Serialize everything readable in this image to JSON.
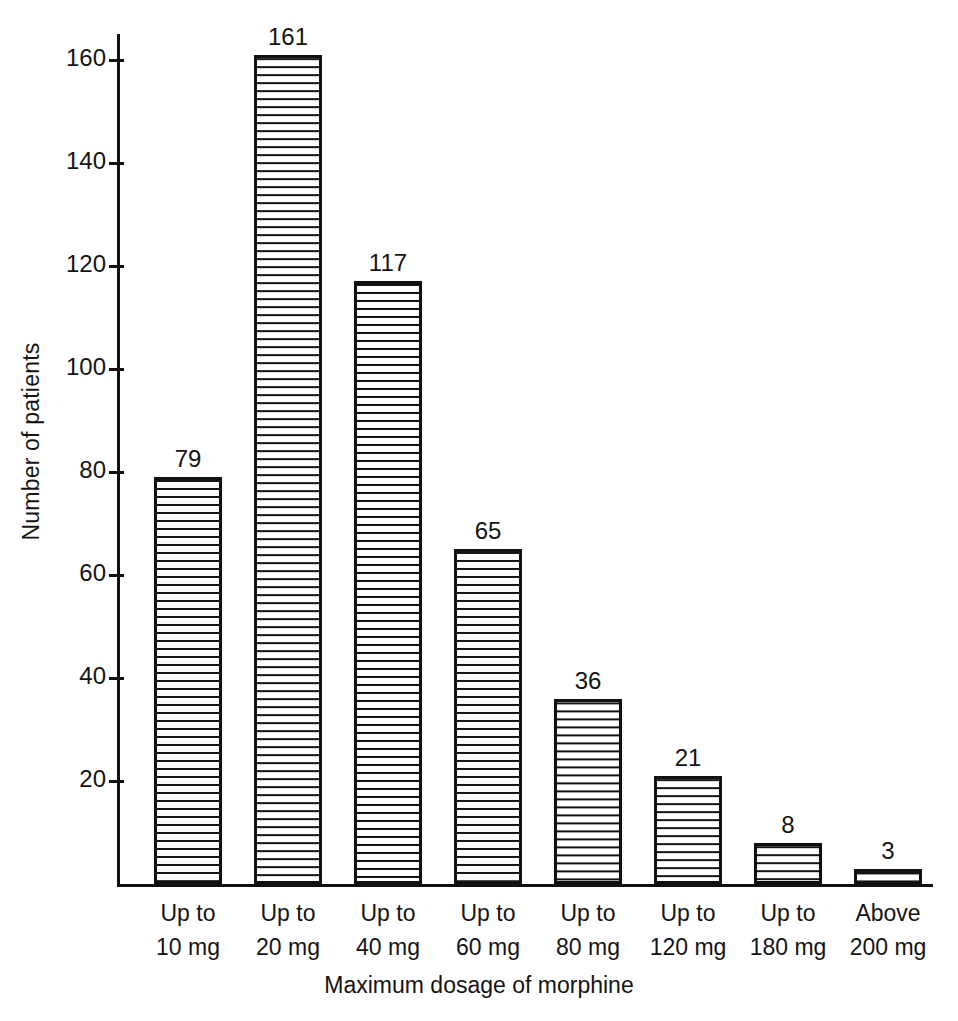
{
  "chart_data": {
    "type": "bar",
    "title": "",
    "xlabel": "Maximum dosage of morphine",
    "ylabel": "Number of patients",
    "categories": [
      "Up to 10 mg",
      "Up to 20 mg",
      "Up to 40 mg",
      "Up to 60 mg",
      "Up to 80 mg",
      "Up to 120 mg",
      "Up to 180 mg",
      "Above 200 mg"
    ],
    "category_lines": [
      [
        "Up to",
        "10 mg"
      ],
      [
        "Up to",
        "20 mg"
      ],
      [
        "Up to",
        "40 mg"
      ],
      [
        "Up to",
        "60 mg"
      ],
      [
        "Up to",
        "80 mg"
      ],
      [
        "Up to",
        "120 mg"
      ],
      [
        "Up to",
        "180 mg"
      ],
      [
        "Above",
        "200 mg"
      ]
    ],
    "values": [
      79,
      161,
      117,
      65,
      36,
      21,
      8,
      3
    ],
    "value_labels": [
      "79",
      "161",
      "117",
      "65",
      "36",
      "21",
      "8",
      "3"
    ],
    "ylim": [
      0,
      168
    ],
    "yticks": [
      20,
      40,
      60,
      80,
      100,
      120,
      140,
      160
    ],
    "ytick_labels": [
      "20",
      "40",
      "60",
      "80",
      "100",
      "120",
      "140",
      "160"
    ],
    "grid": false,
    "legend": false,
    "bar_fill": "horizontal-hatch",
    "bar_edge_color": "#111111",
    "bar_face_color": "#ffffff",
    "axis_color": "#111111"
  },
  "axes": {
    "y_title": "Number of patients",
    "x_title": "Maximum dosage of morphine"
  }
}
